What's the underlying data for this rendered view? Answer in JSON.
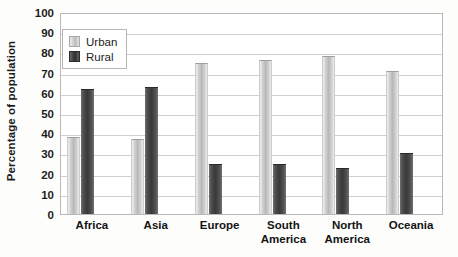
{
  "chart_data": {
    "type": "bar",
    "title": "",
    "xlabel": "",
    "ylabel": "Percentage of population",
    "ylim": [
      0,
      100
    ],
    "ytick_step": 10,
    "yticks": [
      100,
      90,
      80,
      70,
      60,
      50,
      40,
      30,
      20,
      10,
      0
    ],
    "grid": true,
    "legend_position": "top-left",
    "categories": [
      "Africa",
      "Asia",
      "Europe",
      "South America",
      "North America",
      "Oceania"
    ],
    "category_labels": [
      "Africa",
      "Asia",
      "Europe",
      "South\nAmerica",
      "North\nAmerica",
      "Oceania"
    ],
    "series": [
      {
        "name": "Urban",
        "color": "#bdbdbd",
        "values": [
          38,
          37,
          75,
          76,
          78,
          71
        ]
      },
      {
        "name": "Rural",
        "color": "#3d3d3d",
        "values": [
          62,
          63,
          25,
          25,
          23,
          30
        ]
      }
    ]
  },
  "legend": {
    "entries": [
      {
        "label": "Urban",
        "swatch": "urban"
      },
      {
        "label": "Rural",
        "swatch": "rural"
      }
    ]
  }
}
